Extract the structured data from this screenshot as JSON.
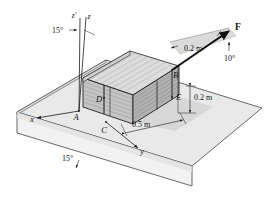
{
  "figure": {
    "background_color": "#ffffff",
    "line_color": "#1a1a1a",
    "ramp_top_color": "#e6e6e6",
    "ramp_side_color": "#d9d9d9",
    "ramp_front_color": "#efefef",
    "crate_color": "#c9c9c9",
    "crate_top_color": "#dadada",
    "crate_side_color": "#b4b4b4",
    "shadow_color": "#cfcfcf",
    "force_plane_color": "#d2d2d2"
  },
  "points": {
    "A": "A",
    "B": "B",
    "C": "C",
    "D": "D",
    "E": "E"
  },
  "axes": {
    "x": "x",
    "y": "y",
    "z": "z",
    "z_prime": "z'"
  },
  "angles": {
    "axis_tilt": "15°",
    "ramp_incline": "15°",
    "force_elevation": "10°"
  },
  "dimensions": {
    "force_offset": "0.2 m",
    "edge_height": "0.2 m",
    "base_width": "0.5 m"
  },
  "force": {
    "label": "F"
  }
}
